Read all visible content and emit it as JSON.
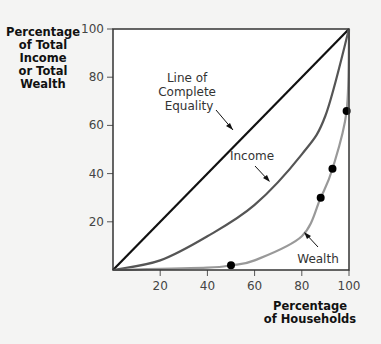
{
  "chart_data": {
    "type": "line",
    "title": "",
    "xlabel": "Percentage of Households",
    "ylabel": "Percentage of Total Income or Total Wealth",
    "xlim": [
      0,
      100
    ],
    "ylim": [
      0,
      100
    ],
    "xticks": [
      20,
      40,
      60,
      80,
      100
    ],
    "yticks": [
      20,
      40,
      60,
      80,
      100
    ],
    "grid": false,
    "series": [
      {
        "name": "Line of Complete Equality",
        "color": "#111111",
        "x": [
          0,
          100
        ],
        "y": [
          0,
          100
        ]
      },
      {
        "name": "Income",
        "color": "#555555",
        "x": [
          0,
          20,
          40,
          60,
          80,
          90,
          100
        ],
        "y": [
          0,
          4,
          14,
          27,
          48,
          64,
          100
        ]
      },
      {
        "name": "Wealth",
        "color": "#999999",
        "x": [
          0,
          40,
          50,
          60,
          80,
          88,
          93,
          99,
          100
        ],
        "y": [
          0,
          1,
          2,
          4,
          14,
          30,
          42,
          66,
          100
        ],
        "markers": [
          {
            "x": 50,
            "y": 2
          },
          {
            "x": 88,
            "y": 30
          },
          {
            "x": 93,
            "y": 42
          },
          {
            "x": 99,
            "y": 66
          }
        ]
      }
    ],
    "annotations": [
      {
        "text": "Line of Complete Equality",
        "target": "equality"
      },
      {
        "text": "Income",
        "target": "income"
      },
      {
        "text": "Wealth",
        "target": "wealth"
      }
    ]
  },
  "labels": {
    "y_axis": [
      "Percentage",
      "of Total",
      "Income",
      "or Total",
      "Wealth"
    ],
    "x_axis": [
      "Percentage",
      "of Households"
    ],
    "equality": [
      "Line of",
      "Complete",
      "Equality"
    ],
    "income": "Income",
    "wealth": "Wealth",
    "ticks": {
      "x": [
        "20",
        "40",
        "60",
        "80",
        "100"
      ],
      "y": [
        "20",
        "40",
        "60",
        "80",
        "100"
      ]
    }
  }
}
